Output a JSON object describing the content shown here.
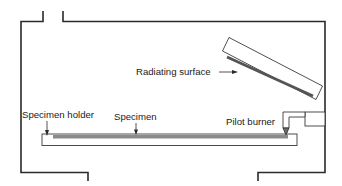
{
  "diagram": {
    "title": "",
    "labels": {
      "radiating_surface": "Radiating surface",
      "specimen_holder": "Specimen holder",
      "specimen": "Specimen",
      "pilot_burner": "Pilot burner"
    },
    "colors": {
      "wall": "#2a2a2a",
      "outline": "#3a3a3a",
      "radiating_bar": "#555555",
      "specimen_bar": "#8a8a8a",
      "background": "#ffffff"
    }
  }
}
